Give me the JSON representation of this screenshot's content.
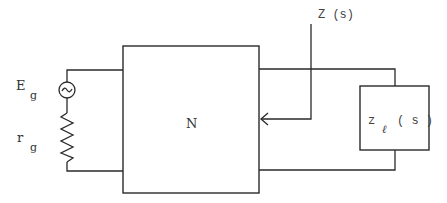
{
  "diagram": {
    "type": "circuit-schematic",
    "colors": {
      "line": "#2a2a2a",
      "text": "#333333",
      "background": "#ffffff"
    },
    "source": {
      "voltage_label": "E",
      "voltage_subscript": "g",
      "resistance_label": "r",
      "resistance_subscript": "g",
      "icon": "ac-source-icon"
    },
    "network": {
      "label": "N"
    },
    "impedance": {
      "label": "Z (s)"
    },
    "load": {
      "label": "z",
      "subscript": "ℓ",
      "argument": "( s )"
    }
  }
}
